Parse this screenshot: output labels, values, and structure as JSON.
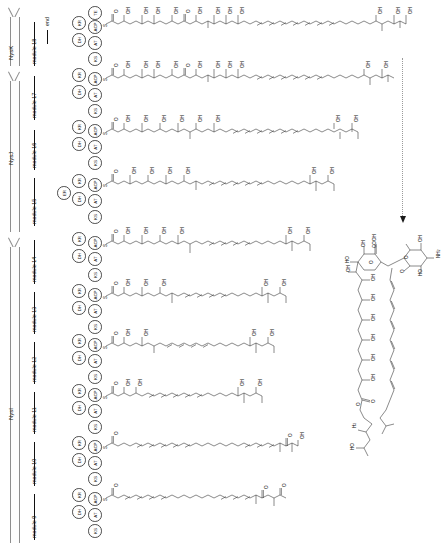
{
  "figure": {
    "orientation": "rotated-90-ccw",
    "terminal_label": "end"
  },
  "proteins": [
    {
      "name": "NysK",
      "modules": [
        "module 18"
      ]
    },
    {
      "name": "NysJ",
      "modules": [
        "module 17",
        "module 16",
        "module 15"
      ]
    },
    {
      "name": "NysI",
      "modules": [
        "module 14",
        "module 13",
        "module 12",
        "module 11",
        "module 10",
        "module 9"
      ]
    }
  ],
  "modules": [
    {
      "label": "module 18",
      "domains": [
        "KS",
        "AT",
        "DH",
        "KR",
        "ACP",
        "TE"
      ],
      "intermediate": "fully elongated polyketide chain with terminal thioesterase release"
    },
    {
      "label": "module 17",
      "domains": [
        "KS",
        "AT",
        "DH",
        "KR",
        "ACP"
      ],
      "intermediate": "polyketide chain, heptaene region extended"
    },
    {
      "label": "module 16",
      "domains": [
        "KS",
        "AT",
        "DH",
        "KR",
        "ACP"
      ],
      "intermediate": "polyketide chain with additional hydroxyl"
    },
    {
      "label": "module 15",
      "domains": [
        "KS",
        "AT",
        "DH",
        "ER",
        "KR",
        "ACP"
      ],
      "intermediate": "polyketide chain, reduced (enoylreductase) unit"
    },
    {
      "label": "module 14",
      "domains": [
        "KS",
        "AT",
        "DH",
        "KR",
        "ACP"
      ],
      "intermediate": "polyketide chain with polyol region"
    },
    {
      "label": "module 13",
      "domains": [
        "KS",
        "AT",
        "DH",
        "KR",
        "ACP"
      ],
      "intermediate": "polyketide chain with polyol region"
    },
    {
      "label": "module 12",
      "domains": [
        "KS",
        "AT",
        "DH",
        "KR",
        "ACP"
      ],
      "intermediate": "polyketide chain, polyene + keto groups"
    },
    {
      "label": "module 11",
      "domains": [
        "KS",
        "AT",
        "DH",
        "KR",
        "ACP"
      ],
      "intermediate": "polyketide chain, polyene + keto groups"
    },
    {
      "label": "module 10",
      "domains": [
        "KS",
        "AT",
        "DH",
        "KR",
        "ACP"
      ],
      "intermediate": "polyene chain with two ketone groups"
    },
    {
      "label": "module 9",
      "domains": [
        "KS",
        "AT",
        "DH",
        "KR",
        "ACP"
      ],
      "intermediate": "shortest polyene chain with two ketone groups"
    }
  ],
  "domain_glossary": {
    "KS": "ketosynthase",
    "AT": "acyltransferase",
    "DH": "dehydratase",
    "ER": "enoylreductase",
    "KR": "ketoreductase",
    "ACP": "acyl carrier protein",
    "TE": "thioesterase"
  },
  "chem_labels": {
    "hydroxyl": "OH",
    "hydroxyl_rev": "HO",
    "amine": "NH",
    "amine_sub": "2",
    "oxygen": "O",
    "sulfur": "S",
    "carbon_h3": "H",
    "c3_sub": "3",
    "carboxyl": "COOH"
  },
  "product": {
    "name": "glycosylated polyene macrolide (mycosamine-bearing)",
    "features": [
      "macrolactone ring",
      "polyol region",
      "heptaene region",
      "COOH",
      "mycosamine sugar",
      "NH2",
      "OH"
    ]
  },
  "colors": {
    "ink": "#111111",
    "line": "#4a4a4a",
    "arrow_outline": "#8d8d8d",
    "dotted": "#9a9a9a",
    "background": "#ffffff"
  }
}
